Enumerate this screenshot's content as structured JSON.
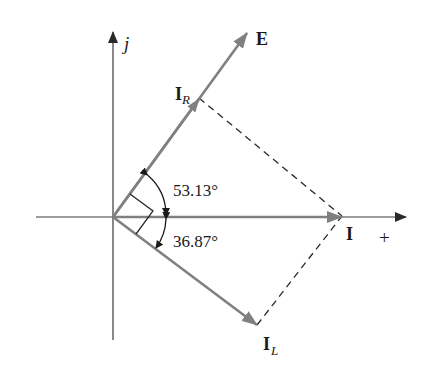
{
  "diagram": {
    "type": "phasor-diagram",
    "axes": {
      "vertical_label": "j",
      "horizontal_label": "+"
    },
    "phasors": [
      {
        "id": "E",
        "label": "E",
        "subscript": ""
      },
      {
        "id": "I_R",
        "label": "I",
        "subscript": "R"
      },
      {
        "id": "I",
        "label": "I",
        "subscript": ""
      },
      {
        "id": "I_L",
        "label": "I",
        "subscript": "L"
      }
    ],
    "angles": [
      {
        "id": "angle-upper",
        "label": "53.13°"
      },
      {
        "id": "angle-lower",
        "label": "36.87°"
      }
    ],
    "colors": {
      "phasor": "#808080",
      "axis": "#3a3a3a",
      "dashed": "#2a2a2a",
      "text": "#1a1a1a"
    }
  }
}
